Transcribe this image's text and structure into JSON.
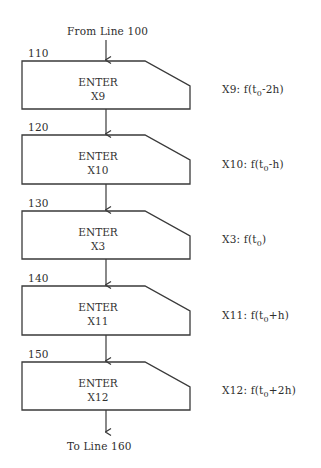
{
  "diagram": {
    "type": "flowchart",
    "entry": {
      "label": "From Line 100"
    },
    "exit": {
      "label": "To Line 160"
    },
    "steps": [
      {
        "line": "110",
        "action": "ENTER",
        "register": "X9",
        "annotation": {
          "prefix": "X9: f(t",
          "sub": "0",
          "suffix": "-2h)"
        }
      },
      {
        "line": "120",
        "action": "ENTER",
        "register": "X10",
        "annotation": {
          "prefix": "X10: f(t",
          "sub": "0",
          "suffix": "-h)"
        }
      },
      {
        "line": "130",
        "action": "ENTER",
        "register": "X3",
        "annotation": {
          "prefix": "X3: f(t",
          "sub": "0",
          "suffix": ")"
        }
      },
      {
        "line": "140",
        "action": "ENTER",
        "register": "X11",
        "annotation": {
          "prefix": "X11: f(t",
          "sub": "0",
          "suffix": "+h)"
        }
      },
      {
        "line": "150",
        "action": "ENTER",
        "register": "X12",
        "annotation": {
          "prefix": "X12: f(t",
          "sub": "0",
          "suffix": "+2h)"
        }
      }
    ],
    "colors": {
      "stroke": "#3a3a3a",
      "text": "#2e2e2e",
      "background": "#ffffff"
    }
  }
}
